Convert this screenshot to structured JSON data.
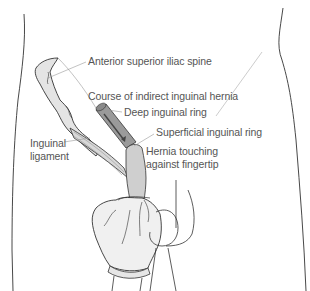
{
  "figure": {
    "colors": {
      "outline": "#333333",
      "skin_fill": "#ffffff",
      "bone_fill": "#e4e4e4",
      "ligament_fill": "#d8d8d8",
      "canal_fill": "#9a9a9a",
      "canal_dark": "#6a6a6a",
      "finger_fill": "#cfcfcf",
      "glove_fill": "#f0f0f0",
      "leader_line": "#999999",
      "label_text": "#555555"
    },
    "labels": [
      {
        "id": "asis",
        "text": "Anterior superior iliac spine"
      },
      {
        "id": "course",
        "text": "Course of indirect inguinal hernia"
      },
      {
        "id": "deep_ring",
        "text": "Deep inguinal ring"
      },
      {
        "id": "superficial_ring",
        "text": "Superficial inguinal ring"
      },
      {
        "id": "ligament_line1",
        "text": "Inguinal"
      },
      {
        "id": "ligament_line2",
        "text": "ligament"
      },
      {
        "id": "hernia_line1",
        "text": "Hernia touching"
      },
      {
        "id": "hernia_line2",
        "text": "against fingertip"
      }
    ]
  }
}
